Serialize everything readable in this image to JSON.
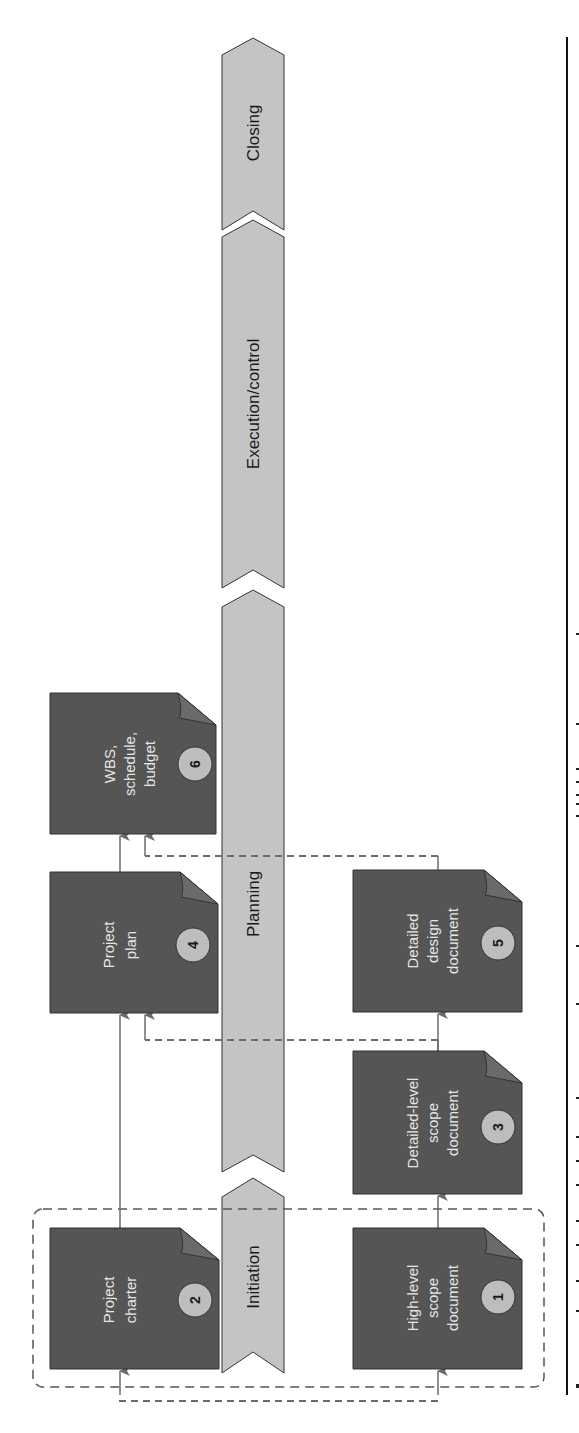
{
  "diagram": {
    "orientation": "rotated-90-ccw",
    "colors": {
      "phase_fill": "#c4c4c4",
      "phase_stroke": "#333333",
      "doc_fill": "#555555",
      "doc_fold": "#6a6a6a",
      "doc_text": "#e6e6e6",
      "badge_fill": "#bdbdbd",
      "arrow": "#6b6b6b",
      "dashed": "#6b6b6b",
      "rule": "#111111"
    },
    "phases": [
      {
        "id": "initiation",
        "label": "Initiation"
      },
      {
        "id": "planning",
        "label": "Planning"
      },
      {
        "id": "execution",
        "label": "Execution/control"
      },
      {
        "id": "closing",
        "label": "Closing"
      }
    ],
    "documents": [
      {
        "id": 1,
        "badge": "1",
        "lines": [
          "High-level",
          "scope",
          "document"
        ]
      },
      {
        "id": 2,
        "badge": "2",
        "lines": [
          "Project",
          "charter"
        ]
      },
      {
        "id": 3,
        "badge": "3",
        "lines": [
          "Detailed-level",
          "scope",
          "document"
        ]
      },
      {
        "id": 4,
        "badge": "4",
        "lines": [
          "Project",
          "plan"
        ]
      },
      {
        "id": 5,
        "badge": "5",
        "lines": [
          "Detailed",
          "design",
          "document"
        ]
      },
      {
        "id": 6,
        "badge": "6",
        "lines": [
          "WBS,",
          "schedule,",
          "budget"
        ]
      }
    ],
    "connections": [
      {
        "from": "1",
        "to": "3",
        "style": "solid"
      },
      {
        "from": "3",
        "to": "5",
        "style": "solid"
      },
      {
        "from": "2",
        "to": "4",
        "style": "solid"
      },
      {
        "from": "4",
        "to": "6",
        "style": "solid"
      },
      {
        "from": "1",
        "to": "2",
        "style": "dashed"
      },
      {
        "from": "3",
        "to": "4",
        "style": "dashed"
      },
      {
        "from": "5",
        "to": "6",
        "style": "dashed"
      }
    ],
    "grouping": {
      "label": "Initiation group (documents 1 and 2)",
      "style": "dashed-rounded-box"
    }
  }
}
